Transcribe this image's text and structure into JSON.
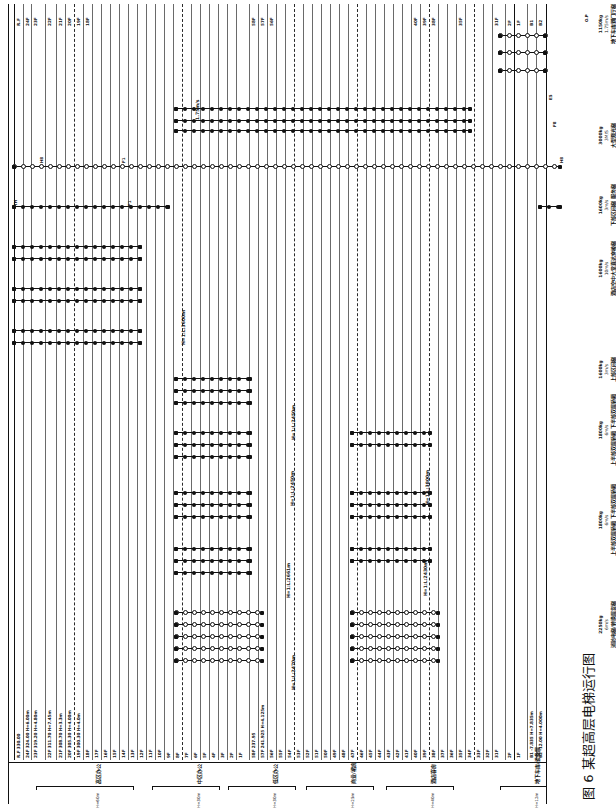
{
  "figure": {
    "caption": "图 6  某超高层电梯运行图",
    "caption_number": "图 6",
    "caption_title": "某超高层电梯运行图"
  },
  "axis": {
    "orientation": "rotated-90",
    "floor_axis_label": "楼层标高",
    "run_axis_label": "电梯分区运行"
  },
  "floors": [
    {
      "name": "R.F",
      "elev": "330.00",
      "height": "",
      "label": "R.F 330.00",
      "tag": "R.F",
      "x": 14,
      "kind": "bold"
    },
    {
      "name": "24F",
      "elev": "324.00",
      "height": "H=6.00m",
      "label": "24F 324.00 H=6.00m",
      "tag": "24F",
      "x": 23,
      "kind": "plain"
    },
    {
      "name": "23F",
      "elev": "319.20",
      "height": "H=4.80m",
      "label": "23F 319.20 H=4.80m",
      "tag": "23F",
      "x": 31,
      "kind": "plain"
    },
    {
      "name": "22F",
      "elev": "311.70",
      "height": "H=7.45m",
      "label": "22F 311.70 H=7.45m",
      "tag": "22F",
      "x": 45,
      "kind": "plain"
    },
    {
      "name": "21F",
      "elev": "308.70",
      "height": "H=3.3m",
      "label": "21F 308.70 H=3.3m",
      "tag": "21F",
      "x": 56,
      "kind": "plain"
    },
    {
      "name": "20F",
      "elev": "305.30",
      "height": "H=4.00m",
      "label": "20F 305.30 H=4.00m",
      "tag": "20F",
      "x": 65,
      "kind": "plain"
    },
    {
      "name": "19F",
      "elev": "300.30",
      "height": "H=4.0m",
      "label": "19F 300.30 H=4.0m",
      "tag": "19F",
      "x": 74,
      "kind": "dash"
    },
    {
      "name": "18F",
      "elev": "",
      "height": "",
      "label": "18F",
      "tag": "18F",
      "x": 83,
      "kind": "plain"
    },
    {
      "name": "17F",
      "elev": "",
      "height": "",
      "label": "17F",
      "tag": "",
      "x": 92,
      "kind": "plain"
    },
    {
      "name": "16F",
      "elev": "",
      "height": "",
      "label": "16F",
      "tag": "",
      "x": 101,
      "kind": "plain"
    },
    {
      "name": "15F",
      "elev": "",
      "height": "",
      "label": "15F",
      "tag": "",
      "x": 110,
      "kind": "plain"
    },
    {
      "name": "14F",
      "elev": "",
      "height": "",
      "label": "14F",
      "tag": "",
      "x": 119,
      "kind": "plain"
    },
    {
      "name": "13F",
      "elev": "",
      "height": "",
      "label": "13F",
      "tag": "",
      "x": 128,
      "kind": "plain"
    },
    {
      "name": "12F",
      "elev": "",
      "height": "",
      "label": "12F",
      "tag": "",
      "x": 137,
      "kind": "plain"
    },
    {
      "name": "11F",
      "elev": "",
      "height": "",
      "label": "11F",
      "tag": "",
      "x": 146,
      "kind": "plain"
    },
    {
      "name": "10F",
      "elev": "",
      "height": "",
      "label": "10F",
      "tag": "",
      "x": 155,
      "kind": "plain"
    },
    {
      "name": "9F",
      "elev": "",
      "height": "",
      "label": "9F",
      "tag": "",
      "x": 164,
      "kind": "plain"
    },
    {
      "name": "8F",
      "elev": "",
      "height": "",
      "label": "8F",
      "tag": "",
      "x": 173,
      "kind": "plain"
    },
    {
      "name": "7F",
      "elev": "",
      "height": "",
      "label": "7F",
      "tag": "",
      "x": 182,
      "kind": "dash"
    },
    {
      "name": "6F",
      "elev": "",
      "height": "",
      "label": "6F",
      "tag": "",
      "x": 191,
      "kind": "plain"
    },
    {
      "name": "5F",
      "elev": "",
      "height": "",
      "label": "5F",
      "tag": "",
      "x": 200,
      "kind": "plain"
    },
    {
      "name": "4F",
      "elev": "",
      "height": "",
      "label": "4F",
      "tag": "",
      "x": 209,
      "kind": "plain"
    },
    {
      "name": "3F",
      "elev": "",
      "height": "",
      "label": "3F",
      "tag": "",
      "x": 218,
      "kind": "plain"
    },
    {
      "name": "2F",
      "elev": "",
      "height": "",
      "label": "2F",
      "tag": "",
      "x": 227,
      "kind": "plain"
    },
    {
      "name": "1F",
      "elev": "",
      "height": "",
      "label": "1F",
      "tag": "",
      "x": 236,
      "kind": "plain"
    },
    {
      "name": "58F",
      "elev": "237.95",
      "height": "",
      "label": "58F 237.95",
      "tag": "58F",
      "x": 249,
      "kind": "plain"
    },
    {
      "name": "57F",
      "elev": "241.925",
      "height": "H=4.125m",
      "label": "57F 241.925 H=4.125m",
      "tag": "57F",
      "x": 258,
      "kind": "plain"
    },
    {
      "name": "56F",
      "elev": "",
      "height": "",
      "label": "56F",
      "tag": "56F",
      "x": 267,
      "kind": "plain"
    },
    {
      "name": "55F",
      "elev": "",
      "height": "",
      "label": "55F",
      "tag": "",
      "x": 276,
      "kind": "plain"
    },
    {
      "name": "54F",
      "elev": "",
      "height": "",
      "label": "54F",
      "tag": "",
      "x": 285,
      "kind": "plain"
    },
    {
      "name": "53F",
      "elev": "",
      "height": "",
      "label": "53F",
      "tag": "",
      "x": 294,
      "kind": "dash"
    },
    {
      "name": "52F",
      "elev": "",
      "height": "",
      "label": "52F",
      "tag": "",
      "x": 303,
      "kind": "plain"
    },
    {
      "name": "51F",
      "elev": "",
      "height": "",
      "label": "51F",
      "tag": "",
      "x": 312,
      "kind": "plain"
    },
    {
      "name": "50F",
      "elev": "",
      "height": "",
      "label": "50F",
      "tag": "",
      "x": 321,
      "kind": "plain"
    },
    {
      "name": "49F",
      "elev": "",
      "height": "",
      "label": "49F",
      "tag": "",
      "x": 330,
      "kind": "plain"
    },
    {
      "name": "48F",
      "elev": "",
      "height": "",
      "label": "48F",
      "tag": "",
      "x": 339,
      "kind": "plain"
    },
    {
      "name": "47F",
      "elev": "",
      "height": "",
      "label": "47F",
      "tag": "",
      "x": 348,
      "kind": "plain"
    },
    {
      "name": "46F",
      "elev": "",
      "height": "",
      "label": "46F",
      "tag": "",
      "x": 357,
      "kind": "dash"
    },
    {
      "name": "45F",
      "elev": "",
      "height": "",
      "label": "45F",
      "tag": "",
      "x": 366,
      "kind": "plain"
    },
    {
      "name": "44F",
      "elev": "",
      "height": "",
      "label": "44F",
      "tag": "",
      "x": 375,
      "kind": "plain"
    },
    {
      "name": "43F",
      "elev": "",
      "height": "",
      "label": "43F",
      "tag": "",
      "x": 384,
      "kind": "plain"
    },
    {
      "name": "42F",
      "elev": "",
      "height": "",
      "label": "42F",
      "tag": "",
      "x": 393,
      "kind": "plain"
    },
    {
      "name": "41F",
      "elev": "",
      "height": "",
      "label": "41F",
      "tag": "",
      "x": 402,
      "kind": "plain"
    },
    {
      "name": "40F",
      "elev": "",
      "height": "",
      "label": "40F",
      "tag": "40F",
      "x": 411,
      "kind": "plain"
    },
    {
      "name": "39F",
      "elev": "",
      "height": "",
      "label": "39F",
      "tag": "39F",
      "x": 420,
      "kind": "plain"
    },
    {
      "name": "38F",
      "elev": "",
      "height": "",
      "label": "38F",
      "tag": "38F",
      "x": 429,
      "kind": "dash"
    },
    {
      "name": "37F",
      "elev": "",
      "height": "",
      "label": "37F",
      "tag": "",
      "x": 438,
      "kind": "plain"
    },
    {
      "name": "36F",
      "elev": "",
      "height": "",
      "label": "36F",
      "tag": "",
      "x": 447,
      "kind": "plain"
    },
    {
      "name": "35F",
      "elev": "",
      "height": "",
      "label": "35F",
      "tag": "35F",
      "x": 456,
      "kind": "plain"
    },
    {
      "name": "34F",
      "elev": "",
      "height": "",
      "label": "34F",
      "tag": "",
      "x": 465,
      "kind": "plain"
    },
    {
      "name": "33F",
      "elev": "",
      "height": "",
      "label": "33F",
      "tag": "",
      "x": 474,
      "kind": "dash"
    },
    {
      "name": "32F",
      "elev": "",
      "height": "",
      "label": "32F",
      "tag": "",
      "x": 483,
      "kind": "plain"
    },
    {
      "name": "31F",
      "elev": "",
      "height": "",
      "label": "31F",
      "tag": "31F",
      "x": 492,
      "kind": "plain"
    },
    {
      "name": "2F",
      "elev": "",
      "height": "",
      "label": "2F",
      "tag": "2F",
      "x": 505,
      "kind": "plain"
    },
    {
      "name": "1F",
      "elev": "",
      "height": "",
      "label": "1F",
      "tag": "1F",
      "x": 514,
      "kind": "bold"
    },
    {
      "name": "B1",
      "elev": "-7.835",
      "height": "H=7.835m",
      "label": "B1 -7.835 H=7.835m",
      "tag": "B1",
      "x": 527,
      "kind": "plain"
    },
    {
      "name": "B2",
      "elev": "-12.00",
      "height": "H=4.000m",
      "label": "B2 -12.00 H=4.000m",
      "tag": "B2",
      "x": 536,
      "kind": "plain"
    }
  ],
  "zones": [
    {
      "label": "高区办公",
      "sub": "H=60m",
      "x1": 36,
      "x2": 132
    },
    {
      "label": "中区办公",
      "sub": "H=30m",
      "x1": 152,
      "x2": 218
    },
    {
      "label": "低区办公",
      "sub": "H=30m",
      "x1": 228,
      "x2": 294
    },
    {
      "label": "商业/裙房",
      "sub": "H=25m",
      "x1": 306,
      "x2": 372
    },
    {
      "label": "酒店客房",
      "sub": "H=40m",
      "x1": 386,
      "x2": 452
    },
    {
      "label": "地下车库/设备层",
      "sub": "H=12m",
      "x1": 500,
      "x2": 545
    }
  ],
  "elevator_groups": [
    {
      "id": "svc",
      "capacity": "2250kg",
      "speed": "6m/s",
      "name": "消防电梯/\n转换层货梯",
      "name_flat": "消防电梯/转换层货梯",
      "spec_x": 598,
      "spec_y": 648
    },
    {
      "id": "low-office",
      "capacity": "1800kg",
      "speed": "6m/s",
      "name": "上半部双层轿厢\n下半部双层轿厢",
      "name_flat": "上半部双层轿厢 下半部双层轿厢",
      "spec_x": 598,
      "spec_y": 556
    },
    {
      "id": "mid-office",
      "capacity": "1800kg",
      "speed": "6m/s",
      "name": "上半部双层轿厢\n下半部双层轿厢",
      "name_flat": "上半部双层轿厢 下半部双层轿厢",
      "spec_x": 598,
      "spec_y": 466
    },
    {
      "id": "high-office",
      "capacity": "1600kg",
      "speed": "3m/s",
      "name": "上部区间梯",
      "name_flat": "上部区间梯",
      "spec_x": 598,
      "spec_y": 382
    },
    {
      "id": "hotel-shuttle",
      "capacity": "1600kg",
      "speed": "10m/s",
      "name": "酒店空中大堂\n直达穿梭梯",
      "name_flat": "酒店空中大堂直达穿梭梯",
      "spec_x": 598,
      "spec_y": 296
    },
    {
      "id": "hotel-guest",
      "capacity": "1600kg",
      "speed": "3m/s",
      "name": "下部区间梯\n服务梯",
      "name_flat": "下部区间梯 服务梯",
      "spec_x": 598,
      "spec_y": 226
    },
    {
      "id": "obs",
      "capacity": "3000kg",
      "speed": "3M/S",
      "name": "大型观光梯",
      "name_flat": "大型观光梯",
      "spec_x": 598,
      "spec_y": 148
    },
    {
      "id": "basement",
      "capacity": "1150kg",
      "speed": "1.75m/s",
      "name": "地下车库\n到门厅梯",
      "name_flat": "地下车库到门厅梯",
      "spec_x": 598,
      "spec_y": 44
    }
  ],
  "run_annotations": [
    {
      "text": "H=1:L:2470m",
      "x": 292,
      "y": 690
    },
    {
      "text": "H=1:L:2661m",
      "x": 287,
      "y": 598
    },
    {
      "text": "H=1:L:2430m",
      "x": 424,
      "y": 596
    },
    {
      "text": "H=1:L:2450m",
      "x": 291,
      "y": 506
    },
    {
      "text": "H=1:L:3800m",
      "x": 426,
      "y": 505
    },
    {
      "text": "H=1:L:2450m",
      "x": 292,
      "y": 440
    },
    {
      "text": "H=1:L:3600m",
      "x": 182,
      "y": 345
    },
    {
      "text": "1.75m/s",
      "x": 196,
      "y": 120
    }
  ],
  "markers_legend": {
    "full_circle": "停靠层（实心）",
    "open_circle": "通过层/门厅（空心）",
    "square": "端部层（方块）"
  },
  "lift_tags": [
    {
      "text": "H8",
      "x": 40,
      "y": 163
    },
    {
      "text": "TH",
      "x": 14,
      "y": 206
    },
    {
      "text": "F1",
      "x": 122,
      "y": 163
    },
    {
      "text": "F1",
      "x": 128,
      "y": 206
    },
    {
      "text": "F8",
      "x": 553,
      "y": 127
    },
    {
      "text": "E5",
      "x": 549,
      "y": 100
    },
    {
      "text": "H8",
      "x": 560,
      "y": 163
    },
    {
      "text": "O.P",
      "x": 585,
      "y": 22
    }
  ]
}
